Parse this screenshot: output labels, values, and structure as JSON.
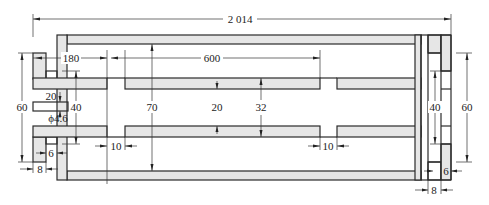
{
  "drawing": {
    "type": "engineering cross-section",
    "dimensions": {
      "overall_length": "2 014",
      "left_offset": "180",
      "segment_length": "600",
      "gap_left": "10",
      "gap_right": "10",
      "outer_height_left": "60",
      "outer_height_right": "60",
      "inner_height_left": "40",
      "inner_height_right": "40",
      "slot_height": "20",
      "hole_diameter": "ϕ4.6",
      "cavity_height": "70",
      "channel_height": "20",
      "duct_height": "32",
      "plate_thickness_left": "6",
      "plate_thickness_right": "6",
      "flange_width_left": "8",
      "flange_width_right": "8"
    }
  }
}
